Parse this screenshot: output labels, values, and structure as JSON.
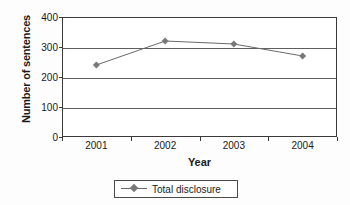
{
  "chart_data": {
    "type": "line",
    "title": "",
    "xlabel": "Year",
    "ylabel": "Number of sentences",
    "categories": [
      "2001",
      "2002",
      "2003",
      "2004"
    ],
    "series": [
      {
        "name": "Total disclosure",
        "values": [
          240,
          320,
          310,
          270
        ]
      }
    ],
    "ylim": [
      0,
      400
    ],
    "yticks": [
      0,
      100,
      200,
      300,
      400
    ],
    "ytick_labels": [
      "0",
      "100",
      "200",
      "300",
      "400"
    ],
    "grid": "horizontal",
    "legend_position": "bottom",
    "marker": "diamond",
    "colors": {
      "line": "#6a6a6a",
      "marker": "#787878",
      "axis": "#3a3a3a",
      "gridline": "#5e5e5e",
      "text": "#1a1a1a",
      "background": "#ffffff"
    }
  },
  "legend": {
    "entries": [
      {
        "label": "Total disclosure",
        "marker_icon": "diamond-marker-icon"
      }
    ]
  }
}
